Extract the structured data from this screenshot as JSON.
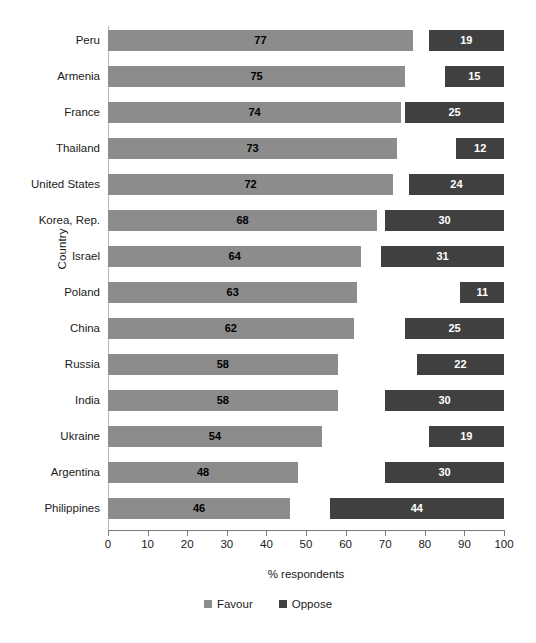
{
  "chart_data": {
    "type": "bar",
    "orientation": "horizontal",
    "title": "",
    "subtitle": "",
    "xlabel": "% respondents",
    "ylabel": "Country",
    "xlim": [
      0,
      100
    ],
    "xticks": [
      0,
      10,
      20,
      30,
      40,
      50,
      60,
      70,
      80,
      90,
      100
    ],
    "grid": false,
    "legend_position": "bottom-center",
    "categories": [
      "Peru",
      "Armenia",
      "France",
      "Thailand",
      "United States",
      "Korea, Rep.",
      "Israel",
      "Poland",
      "China",
      "Russia",
      "India",
      "Ukraine",
      "Argentina",
      "Philippines"
    ],
    "series": [
      {
        "name": "Favour",
        "color": "#8c8c8c",
        "anchor": "left",
        "values": [
          77,
          75,
          74,
          73,
          72,
          68,
          64,
          63,
          62,
          58,
          58,
          54,
          48,
          46
        ]
      },
      {
        "name": "Oppose",
        "color": "#404040",
        "anchor": "right",
        "values": [
          19,
          15,
          25,
          12,
          24,
          30,
          31,
          11,
          25,
          22,
          30,
          19,
          30,
          44
        ]
      }
    ]
  },
  "legend": {
    "items": [
      {
        "label": "Favour",
        "color": "#8c8c8c"
      },
      {
        "label": "Oppose",
        "color": "#404040"
      }
    ]
  },
  "axes": {
    "x_title": "% respondents",
    "y_title": "Country"
  }
}
